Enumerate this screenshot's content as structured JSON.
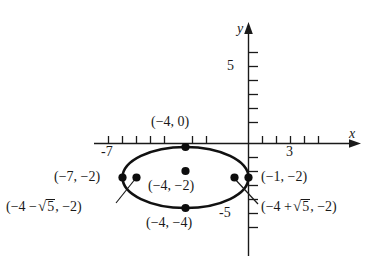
{
  "figure": {
    "kind": "coordinate-plane-ellipse",
    "background_color": "#ffffff",
    "ink_color": "#1a1a1a"
  },
  "axes": {
    "x_axis_label": "x",
    "y_axis_label": "y",
    "x_ticks": [
      {
        "value": -7,
        "label": "-7",
        "show_label": true
      },
      {
        "value": -6,
        "label": "",
        "show_label": false
      },
      {
        "value": -5,
        "label": "",
        "show_label": false
      },
      {
        "value": -4,
        "label": "",
        "show_label": false
      },
      {
        "value": -3,
        "label": "",
        "show_label": false
      },
      {
        "value": -2,
        "label": "",
        "show_label": false
      },
      {
        "value": -1,
        "label": "",
        "show_label": false
      },
      {
        "value": 1,
        "label": "",
        "show_label": false
      },
      {
        "value": 2,
        "label": "",
        "show_label": false
      },
      {
        "value": 3,
        "label": "3",
        "show_label": true
      },
      {
        "value": 4,
        "label": "",
        "show_label": false
      }
    ],
    "y_ticks": [
      {
        "value": 5,
        "label": "5",
        "show_label": true
      },
      {
        "value": 4,
        "label": "",
        "show_label": false
      },
      {
        "value": 3,
        "label": "",
        "show_label": false
      },
      {
        "value": 2,
        "label": "",
        "show_label": false
      },
      {
        "value": 1,
        "label": "",
        "show_label": false
      },
      {
        "value": -1,
        "label": "",
        "show_label": false
      },
      {
        "value": -2,
        "label": "",
        "show_label": false
      },
      {
        "value": -3,
        "label": "",
        "show_label": false
      },
      {
        "value": -4,
        "label": "",
        "show_label": false
      },
      {
        "value": -5,
        "label": "-5",
        "show_label": true
      }
    ],
    "x_tick_label_minus7": "-7",
    "x_tick_label_3": "3",
    "y_tick_label_5": "5",
    "y_tick_label_minus5": "-5"
  },
  "ellipse": {
    "center": {
      "x": -4,
      "y": -2
    },
    "semi_major_a": 3,
    "semi_minor_b": 2,
    "orientation": "horizontal"
  },
  "points": [
    {
      "id": "top-vertex",
      "label": "(-4, 0)",
      "x": -4,
      "y": 0
    },
    {
      "id": "left-vertex",
      "label": "(-7, -2)",
      "x": -7,
      "y": -2
    },
    {
      "id": "center",
      "label": "(-4, -2)",
      "x": -4,
      "y": -2
    },
    {
      "id": "right-vertex",
      "label": "(-1, -2)",
      "x": -1,
      "y": -2
    },
    {
      "id": "bottom-vertex",
      "label": "(-4, -4)",
      "x": -4,
      "y": -4
    },
    {
      "id": "focus-left",
      "label": "(-4 - √5, -2)",
      "x": -6.236,
      "y": -2
    },
    {
      "id": "focus-right",
      "label": "(-4 + √5, -2)",
      "x": -1.764,
      "y": -2
    }
  ],
  "labels": {
    "top_vertex": "(−4, 0)",
    "left_vertex": "(−7, −2)",
    "center": "(−4, −2)",
    "right_vertex": "(−1, −2)",
    "bottom_vertex": "(−4, −4)",
    "focus_left_prefix": "(−4 −",
    "focus_left_radicand": "5",
    "focus_left_suffix": ", −2)",
    "focus_right_prefix": "(−4 +",
    "focus_right_radicand": "5",
    "focus_right_suffix": ", −2)",
    "radical_sign": "√"
  }
}
